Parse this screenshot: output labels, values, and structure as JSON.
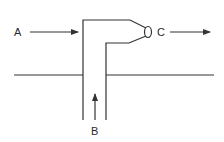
{
  "diagram": {
    "labels": {
      "a": "A",
      "b": "B",
      "c": "C"
    },
    "arrows": [
      {
        "id": "A",
        "direction": "right",
        "meaning": "flow A toward pipe"
      },
      {
        "id": "B",
        "direction": "up",
        "meaning": "flow B up the pipe"
      },
      {
        "id": "C",
        "direction": "right",
        "meaning": "flow C exiting nozzle"
      }
    ],
    "colors": {
      "stroke": "#333333",
      "background": "#ffffff"
    }
  }
}
